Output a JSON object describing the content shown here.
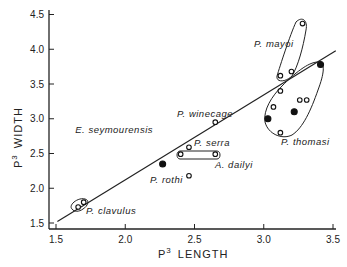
{
  "chart_data": {
    "type": "scatter",
    "title": "",
    "xlabel": "P3 LENGTH",
    "ylabel": "P3 WIDTH",
    "xlabel_parts": {
      "main": "P",
      "sup": "3",
      "rest": "LENGTH"
    },
    "ylabel_parts": {
      "main": "P",
      "sup": "3",
      "rest": "WIDTH"
    },
    "xlim": [
      1.5,
      3.5
    ],
    "ylim": [
      1.5,
      4.5
    ],
    "xticks": [
      "1.5",
      "2.0",
      "2.5",
      "3.0",
      "3.5"
    ],
    "yticks": [
      "1.5",
      "2.0",
      "2.5",
      "3.0",
      "3.5",
      "4.0",
      "4.5"
    ],
    "grid": false,
    "legend": "none",
    "regression_line": {
      "x": [
        1.51,
        3.52
      ],
      "y": [
        1.52,
        3.98
      ]
    },
    "groups": [
      {
        "name": "P. clavulus",
        "enclosed": true,
        "points": [
          {
            "x": 1.66,
            "y": 1.73,
            "filled": false
          },
          {
            "x": 1.7,
            "y": 1.8,
            "filled": false
          }
        ]
      },
      {
        "name": "E. seymourensis",
        "enclosed": false,
        "points": [
          {
            "x": 2.27,
            "y": 2.35,
            "filled": true
          }
        ]
      },
      {
        "name": "P. winecage",
        "enclosed": false,
        "points": [
          {
            "x": 2.65,
            "y": 2.95,
            "filled": false
          }
        ]
      },
      {
        "name": "P. serra",
        "enclosed": false,
        "points": [
          {
            "x": 2.46,
            "y": 2.59,
            "filled": false
          }
        ]
      },
      {
        "name": "A. dailyi",
        "enclosed": true,
        "points": [
          {
            "x": 2.4,
            "y": 2.49,
            "filled": false
          },
          {
            "x": 2.65,
            "y": 2.49,
            "filled": false
          }
        ]
      },
      {
        "name": "P. rothi",
        "enclosed": false,
        "points": [
          {
            "x": 2.46,
            "y": 2.18,
            "filled": false
          }
        ]
      },
      {
        "name": "P. mayoi",
        "enclosed": true,
        "points": [
          {
            "x": 3.28,
            "y": 4.37,
            "filled": false
          },
          {
            "x": 3.2,
            "y": 3.68,
            "filled": false
          },
          {
            "x": 3.12,
            "y": 3.62,
            "filled": false
          }
        ]
      },
      {
        "name": "P. thomasi",
        "enclosed": true,
        "points": [
          {
            "x": 3.41,
            "y": 3.78,
            "filled": true
          },
          {
            "x": 3.12,
            "y": 3.4,
            "filled": false
          },
          {
            "x": 3.07,
            "y": 3.17,
            "filled": false
          },
          {
            "x": 3.26,
            "y": 3.27,
            "filled": false
          },
          {
            "x": 3.31,
            "y": 3.27,
            "filled": false
          },
          {
            "x": 3.03,
            "y": 3.0,
            "filled": true
          },
          {
            "x": 3.22,
            "y": 3.1,
            "filled": true
          },
          {
            "x": 3.12,
            "y": 2.8,
            "filled": false
          }
        ]
      }
    ]
  }
}
